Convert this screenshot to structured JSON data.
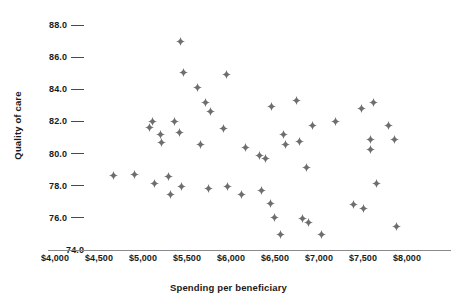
{
  "chart_data": {
    "type": "scatter",
    "title": "",
    "xlabel": "Spending per beneficiary",
    "ylabel": "Quality of care",
    "xlim": [
      4000,
      8000
    ],
    "ylim": [
      74.0,
      88.0
    ],
    "grid": false,
    "legend": null,
    "marker_color": "#6e6e6e",
    "marker_shape": "four-pointed-star",
    "xticks": [
      4000,
      4500,
      5000,
      5500,
      6000,
      6500,
      7000,
      7500,
      8000
    ],
    "xticklabels": [
      "$4,000",
      "$4,500",
      "$5,000",
      "$5,500",
      "$6,000",
      "$6,500",
      "$7,000",
      "$7,500",
      "$8,000"
    ],
    "yticks": [
      74.0,
      76.0,
      78.0,
      80.0,
      82.0,
      84.0,
      86.0,
      88.0
    ],
    "yticklabels": [
      "74.0",
      "76.0",
      "78.0",
      "80.0",
      "82.0",
      "84.0",
      "86.0",
      "88.0"
    ],
    "points": [
      {
        "x": 4660,
        "y": 78.65
      },
      {
        "x": 4900,
        "y": 78.7
      },
      {
        "x": 5070,
        "y": 81.6
      },
      {
        "x": 5110,
        "y": 82.0
      },
      {
        "x": 5135,
        "y": 78.15
      },
      {
        "x": 5195,
        "y": 81.2
      },
      {
        "x": 5215,
        "y": 80.7
      },
      {
        "x": 5290,
        "y": 78.55
      },
      {
        "x": 5310,
        "y": 77.45
      },
      {
        "x": 5355,
        "y": 82.0
      },
      {
        "x": 5410,
        "y": 81.3
      },
      {
        "x": 5430,
        "y": 86.95
      },
      {
        "x": 5440,
        "y": 77.95
      },
      {
        "x": 5460,
        "y": 85.05
      },
      {
        "x": 5620,
        "y": 84.1
      },
      {
        "x": 5650,
        "y": 80.55
      },
      {
        "x": 5705,
        "y": 83.15
      },
      {
        "x": 5740,
        "y": 77.85
      },
      {
        "x": 5765,
        "y": 82.6
      },
      {
        "x": 5910,
        "y": 81.55
      },
      {
        "x": 5945,
        "y": 84.9
      },
      {
        "x": 5960,
        "y": 77.95
      },
      {
        "x": 6120,
        "y": 77.45
      },
      {
        "x": 6160,
        "y": 80.4
      },
      {
        "x": 6325,
        "y": 79.85
      },
      {
        "x": 6350,
        "y": 77.7
      },
      {
        "x": 6390,
        "y": 79.7
      },
      {
        "x": 6450,
        "y": 76.9
      },
      {
        "x": 6465,
        "y": 82.9
      },
      {
        "x": 6490,
        "y": 76.05
      },
      {
        "x": 6560,
        "y": 74.95
      },
      {
        "x": 6600,
        "y": 81.2
      },
      {
        "x": 6615,
        "y": 80.55
      },
      {
        "x": 6745,
        "y": 83.3
      },
      {
        "x": 6775,
        "y": 80.75
      },
      {
        "x": 6815,
        "y": 75.95
      },
      {
        "x": 6860,
        "y": 79.15
      },
      {
        "x": 6880,
        "y": 75.7
      },
      {
        "x": 6925,
        "y": 81.75
      },
      {
        "x": 7030,
        "y": 74.95
      },
      {
        "x": 7185,
        "y": 82.0
      },
      {
        "x": 7395,
        "y": 76.85
      },
      {
        "x": 7480,
        "y": 82.8
      },
      {
        "x": 7500,
        "y": 76.6
      },
      {
        "x": 7580,
        "y": 80.85
      },
      {
        "x": 7585,
        "y": 80.25
      },
      {
        "x": 7615,
        "y": 83.2
      },
      {
        "x": 7655,
        "y": 78.15
      },
      {
        "x": 7785,
        "y": 81.75
      },
      {
        "x": 7855,
        "y": 80.85
      },
      {
        "x": 7885,
        "y": 75.45
      }
    ]
  }
}
